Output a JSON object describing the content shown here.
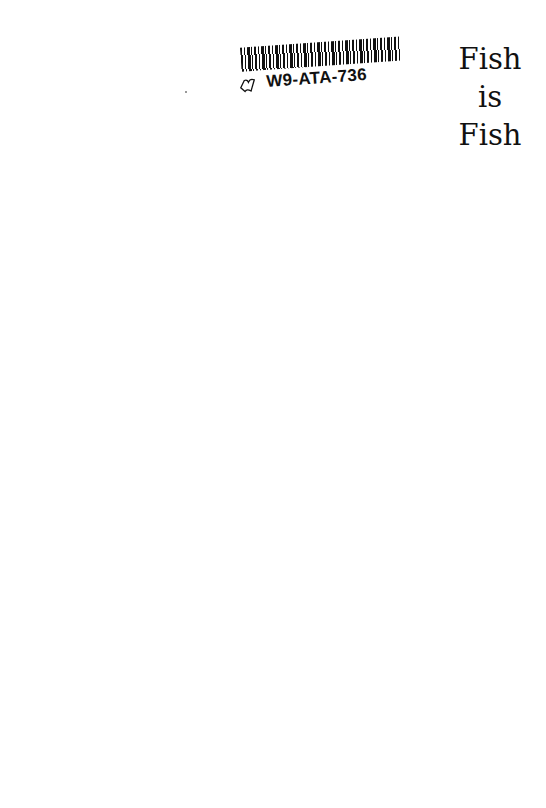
{
  "sticker": {
    "code": "W9-ATA-736",
    "icon": "book-outline-icon"
  },
  "title": {
    "lines": [
      "Fish",
      "is",
      "Fish"
    ]
  },
  "colors": {
    "background": "#ffffff",
    "ink": "#111111"
  }
}
